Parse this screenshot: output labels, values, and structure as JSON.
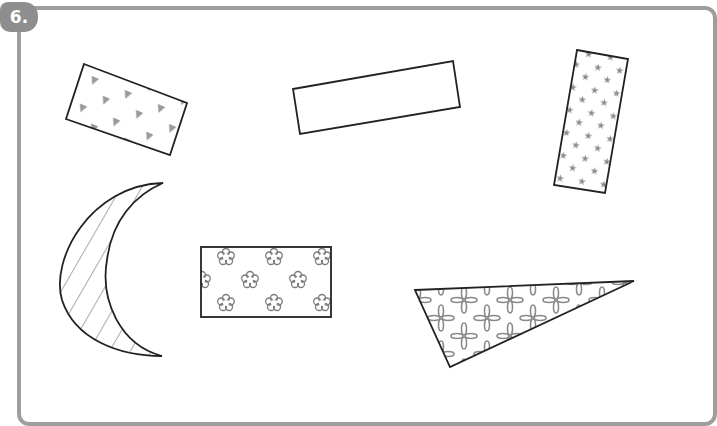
{
  "exercise": {
    "number_label": "6."
  },
  "colors": {
    "frame": "#9e9e9e",
    "badge": "#8e8e8e",
    "outline": "#222222",
    "pattern": "#8c8c8c"
  },
  "shapes": [
    {
      "id": "triangles-rectangle",
      "type": "rectangle",
      "pattern": "triangles",
      "rotation_deg": 23
    },
    {
      "id": "plain-rectangle",
      "type": "rectangle",
      "pattern": "none",
      "rotation_deg": -10
    },
    {
      "id": "stars-rectangle",
      "type": "rectangle",
      "pattern": "stars",
      "rotation_deg": 8
    },
    {
      "id": "crescent",
      "type": "crescent",
      "pattern": "diagonal-stripes"
    },
    {
      "id": "flowers-rectangle",
      "type": "rectangle",
      "pattern": "flowers",
      "rotation_deg": 0
    },
    {
      "id": "petals-triangle",
      "type": "triangle",
      "pattern": "four-petal-flowers"
    }
  ]
}
